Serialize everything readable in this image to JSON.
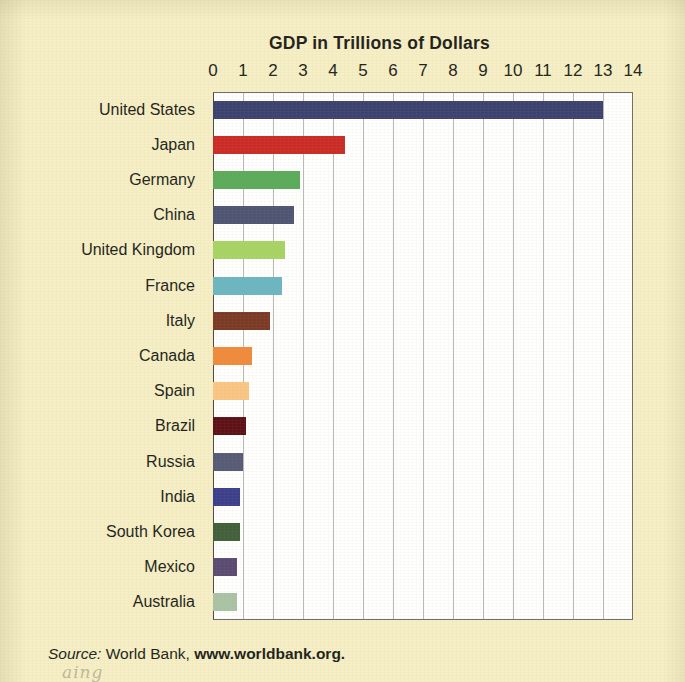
{
  "figure": {
    "title": "GDP in Trillions of Dollars",
    "background_color": "#f6efc6",
    "plot_background_color": "#ffffff",
    "source_prefix": "Source:",
    "source_text": " World Bank, ",
    "source_url": "www.worldbank.org.",
    "scan_smudge": "aing"
  },
  "chart_data": {
    "type": "bar",
    "orientation": "horizontal",
    "title": "GDP in Trillions of Dollars",
    "xlabel": "GDP in Trillions of Dollars",
    "ylabel": "",
    "xlim": [
      0,
      14
    ],
    "grid": true,
    "legend": "none",
    "xticks": [
      0,
      1,
      2,
      3,
      4,
      5,
      6,
      7,
      8,
      9,
      10,
      11,
      12,
      13,
      14
    ],
    "xtick_labels": [
      "0",
      "1",
      "2",
      "3",
      "4",
      "5",
      "6",
      "7",
      "8",
      "9",
      "10",
      "11",
      "12",
      "13",
      "14"
    ],
    "categories": [
      "United States",
      "Japan",
      "Germany",
      "China",
      "United Kingdom",
      "France",
      "Italy",
      "Canada",
      "Spain",
      "Brazil",
      "Russia",
      "India",
      "South Korea",
      "Mexico",
      "Australia"
    ],
    "values": [
      13.0,
      4.4,
      2.9,
      2.7,
      2.4,
      2.3,
      1.9,
      1.3,
      1.2,
      1.1,
      1.0,
      0.9,
      0.9,
      0.8,
      0.8
    ],
    "bar_colors": [
      "#3c4270",
      "#cb2b26",
      "#5aab5a",
      "#4e5573",
      "#a8d465",
      "#6cb6c2",
      "#7b3a26",
      "#f08a3c",
      "#fac684",
      "#5d1017",
      "#565b77",
      "#3b3f8c",
      "#41603c",
      "#5b4a74",
      "#a9c3a4"
    ]
  }
}
